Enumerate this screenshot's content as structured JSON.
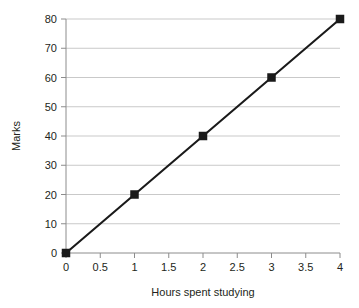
{
  "chart_data": {
    "type": "line",
    "title": "",
    "subtitle": "",
    "xlabel": "Hours spent studying",
    "ylabel": "Marks",
    "xlim": [
      0,
      4
    ],
    "ylim": [
      0,
      80
    ],
    "grid": "horizontal",
    "legend": "none",
    "marker": "square",
    "marker_color": "#1a1a1a",
    "line_color": "#1a1a1a",
    "grid_color": "#c9c9c9",
    "axis_color": "#8c8c8c",
    "text_color": "#231f20",
    "background": "#ffffff",
    "x": [
      0,
      1,
      2,
      3,
      4
    ],
    "values": [
      0,
      20,
      40,
      60,
      80
    ],
    "series": [
      {
        "name": "Marks vs hours",
        "points": [
          {
            "x": 0,
            "y": 0
          },
          {
            "x": 1,
            "y": 20
          },
          {
            "x": 2,
            "y": 40
          },
          {
            "x": 3,
            "y": 60
          },
          {
            "x": 4,
            "y": 80
          }
        ]
      }
    ],
    "xticks": [
      0,
      0.5,
      1,
      1.5,
      2,
      2.5,
      3,
      3.5,
      4
    ],
    "xticklabels": [
      "0",
      "0.5",
      "1",
      "1.5",
      "2",
      "2.5",
      "3",
      "3.5",
      "4"
    ],
    "yticks": [
      0,
      10,
      20,
      30,
      40,
      50,
      60,
      70,
      80
    ],
    "yticklabels": [
      "0",
      "10",
      "20",
      "30",
      "40",
      "50",
      "60",
      "70",
      "80"
    ]
  }
}
